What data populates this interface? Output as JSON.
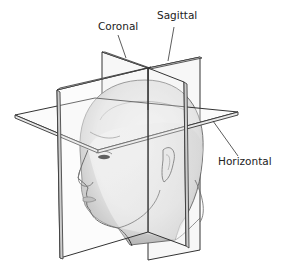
{
  "diagram": {
    "labels": {
      "coronal": "Coronal",
      "sagittal": "Sagittal",
      "horizontal": "Horizontal"
    },
    "colors": {
      "plane_edge": "#333333",
      "plane_fill": "#f4f4f4",
      "head_shade": "#dcdcdc",
      "leader_line": "#333333"
    }
  }
}
